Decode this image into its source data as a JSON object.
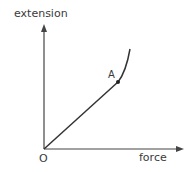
{
  "diagram": {
    "type": "graph-sketch",
    "y_axis_label": "extension",
    "x_axis_label": "force",
    "origin_label": "O",
    "point_label": "A",
    "colors": {
      "line": "#333333",
      "axis": "#444444",
      "text": "#3a3a3a"
    }
  }
}
